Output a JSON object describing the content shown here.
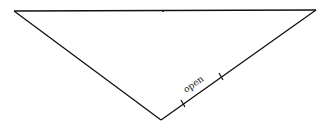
{
  "diagram": {
    "type": "triangle",
    "vertices": {
      "top_left": [
        14,
        11
      ],
      "top_right": [
        316,
        10
      ],
      "bottom": [
        161,
        120
      ]
    },
    "top_mid_mark": [
      163,
      11
    ],
    "ticks": [
      [
        183,
        104
      ],
      [
        221,
        77
      ]
    ],
    "segment_label": "open",
    "stroke_color": "#111111"
  }
}
